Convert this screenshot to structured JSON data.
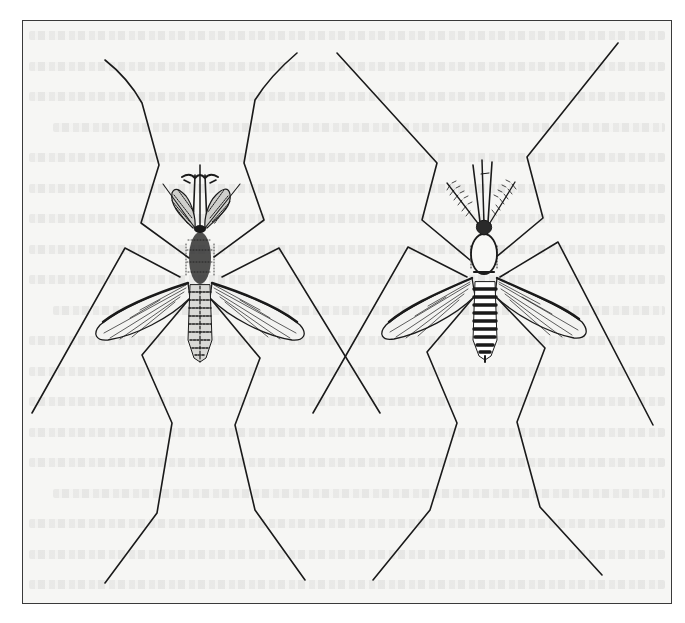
{
  "figure": {
    "frame_color": "#3a3a3a",
    "paper_color": "#f6f6f4",
    "ink_color": "#1a1a1a",
    "specimens": [
      {
        "id": "left",
        "label": "Mosquito with plumose (feathery) antennae"
      },
      {
        "id": "right",
        "label": "Mosquito with slender antennae and long palps"
      }
    ],
    "background_text_lines": 19
  }
}
